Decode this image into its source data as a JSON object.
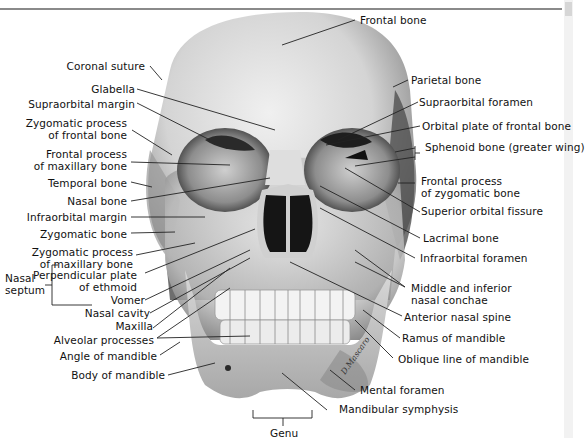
{
  "figure": {
    "labels_left": [
      {
        "id": "coronal_suture",
        "text": "Coronal suture"
      },
      {
        "id": "glabella",
        "text": "Glabella"
      },
      {
        "id": "supraorbital_margin",
        "text": "Supraorbital margin"
      },
      {
        "id": "zygomatic_process_frontal",
        "text": "Zygomatic process\nof frontal bone"
      },
      {
        "id": "frontal_process_maxillary",
        "text": "Frontal process\nof maxillary bone"
      },
      {
        "id": "temporal_bone",
        "text": "Temporal bone"
      },
      {
        "id": "nasal_bone",
        "text": "Nasal bone"
      },
      {
        "id": "infraorbital_margin",
        "text": "Infraorbital margin"
      },
      {
        "id": "zygomatic_bone",
        "text": "Zygomatic bone"
      },
      {
        "id": "zygomatic_process_maxillary",
        "text": "Zygomatic process\nof maxillary bone"
      },
      {
        "id": "perpendicular_plate",
        "text": "Perpendicular plate\nof ethmoid"
      },
      {
        "id": "vomer",
        "text": "Vomer"
      },
      {
        "id": "nasal_cavity",
        "text": "Nasal cavity"
      },
      {
        "id": "maxilla",
        "text": "Maxilla"
      },
      {
        "id": "alveolar_processes",
        "text": "Alveolar processes"
      },
      {
        "id": "angle_of_mandible",
        "text": "Angle of mandible"
      },
      {
        "id": "body_of_mandible",
        "text": "Body of mandible"
      }
    ],
    "group_label": {
      "text": "Nasal\nseptum"
    },
    "labels_right": [
      {
        "id": "frontal_bone",
        "text": "Frontal bone"
      },
      {
        "id": "parietal_bone",
        "text": "Parietal bone"
      },
      {
        "id": "supraorbital_foramen",
        "text": "Supraorbital foramen"
      },
      {
        "id": "orbital_plate",
        "text": "Orbital plate of frontal bone"
      },
      {
        "id": "sphenoid_bone",
        "text": "Sphenoid bone (greater wing)"
      },
      {
        "id": "frontal_process_zygomatic",
        "text": "Frontal process\nof zygomatic bone"
      },
      {
        "id": "superior_orbital_fissure",
        "text": "Superior orbital fissure"
      },
      {
        "id": "lacrimal_bone",
        "text": "Lacrimal bone"
      },
      {
        "id": "infraorbital_foramen",
        "text": "Infraorbital foramen"
      },
      {
        "id": "nasal_conchae",
        "text": "Middle and inferior\nnasal conchae"
      },
      {
        "id": "anterior_nasal_spine",
        "text": "Anterior nasal spine"
      },
      {
        "id": "ramus_of_mandible",
        "text": "Ramus of mandible"
      },
      {
        "id": "oblique_line",
        "text": "Oblique line of mandible"
      },
      {
        "id": "mental_foramen",
        "text": "Mental foramen"
      },
      {
        "id": "mandibular_symphysis",
        "text": "Mandibular symphysis"
      }
    ],
    "bottom_label": {
      "text": "Genu"
    },
    "signature": "D.Mascaro",
    "colors": {
      "background": "#ffffff",
      "text": "#111111",
      "leader": "#222222",
      "bone_light": "#e6e6e6",
      "bone_dark": "#7a7a7a",
      "cavity": "#1a1a1a"
    }
  }
}
